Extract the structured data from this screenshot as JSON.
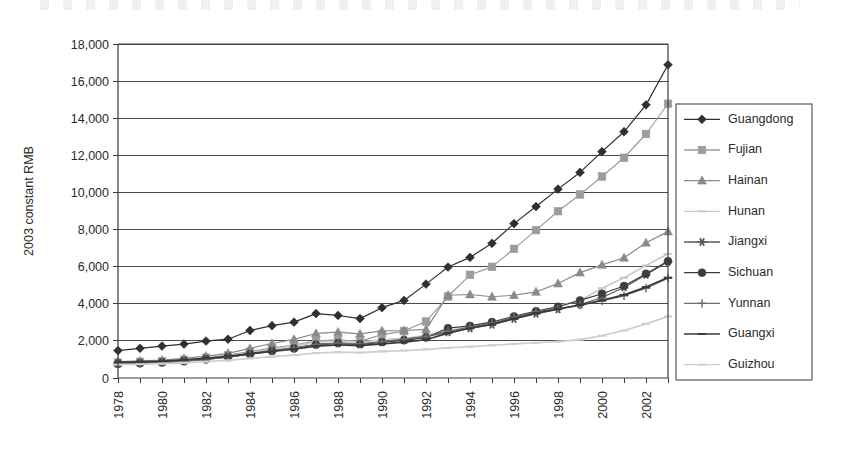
{
  "chart_data": {
    "type": "line",
    "title": "",
    "subtitle": "",
    "xlabel": "",
    "ylabel": "2003 constant RMB",
    "ylim": [
      0,
      18000
    ],
    "ytick_labels": [
      "0",
      "2,000",
      "4,000",
      "6,000",
      "8,000",
      "10,000",
      "12,000",
      "14,000",
      "16,000",
      "18,000"
    ],
    "ytick_values": [
      0,
      2000,
      4000,
      6000,
      8000,
      10000,
      12000,
      14000,
      16000,
      18000
    ],
    "grid": "horizontal",
    "legend_position": "right-outside",
    "x": [
      1978,
      1979,
      1980,
      1981,
      1982,
      1983,
      1984,
      1985,
      1986,
      1987,
      1988,
      1989,
      1990,
      1991,
      1992,
      1993,
      1994,
      1995,
      1996,
      1997,
      1998,
      1999,
      2000,
      2001,
      2002,
      2003
    ],
    "xtick_labels": [
      "1978",
      "1980",
      "1982",
      "1984",
      "1986",
      "1988",
      "1990",
      "1992",
      "1994",
      "1996",
      "1998",
      "2000",
      "2002"
    ],
    "xtick_values": [
      1978,
      1980,
      1982,
      1984,
      1986,
      1988,
      1990,
      1992,
      1994,
      1996,
      1998,
      2000,
      2002
    ],
    "series": [
      {
        "name": "Guangdong",
        "marker": "diamond",
        "color": "#2f2f2f",
        "values": [
          1480,
          1600,
          1720,
          1830,
          1990,
          2090,
          2560,
          2820,
          3010,
          3470,
          3370,
          3200,
          3790,
          4180,
          5060,
          5980,
          6500,
          7260,
          8320,
          9240,
          10180,
          11080,
          12200,
          13270,
          14720,
          16880
        ]
      },
      {
        "name": "Fujian",
        "marker": "square",
        "color": "#9c9c9c",
        "values": [
          830,
          870,
          900,
          980,
          1090,
          1230,
          1420,
          1620,
          1780,
          2000,
          2060,
          1980,
          2340,
          2530,
          3050,
          4390,
          5560,
          5990,
          6960,
          7970,
          8990,
          9890,
          10860,
          11870,
          13150,
          14780
        ]
      },
      {
        "name": "Hainan",
        "marker": "triangle",
        "color": "#8a8a8a",
        "values": [
          880,
          920,
          970,
          1060,
          1180,
          1330,
          1600,
          1860,
          2080,
          2400,
          2470,
          2380,
          2540,
          2560,
          2620,
          4460,
          4500,
          4380,
          4460,
          4640,
          5090,
          5680,
          6100,
          6480,
          7290,
          7890
        ]
      },
      {
        "name": "Hunan",
        "marker": "dash",
        "color": "#c9c9c9",
        "values": [
          790,
          820,
          860,
          940,
          1040,
          1170,
          1350,
          1540,
          1700,
          1930,
          1990,
          1930,
          2060,
          2140,
          2290,
          2540,
          2760,
          2960,
          3250,
          3540,
          3870,
          4180,
          4840,
          5400,
          6060,
          6690
        ]
      },
      {
        "name": "Jiangxi",
        "marker": "star",
        "color": "#585858",
        "values": [
          800,
          830,
          870,
          950,
          1060,
          1180,
          1330,
          1490,
          1610,
          1800,
          1870,
          1800,
          1930,
          2070,
          2230,
          2460,
          2680,
          2870,
          3180,
          3460,
          3700,
          3960,
          4340,
          4880,
          5560,
          6260
        ]
      },
      {
        "name": "Sichuan",
        "marker": "circle",
        "color": "#3d3d3d",
        "values": [
          760,
          790,
          830,
          900,
          1000,
          1120,
          1280,
          1450,
          1590,
          1800,
          1880,
          1830,
          1930,
          2030,
          2180,
          2690,
          2810,
          3020,
          3320,
          3600,
          3840,
          4180,
          4540,
          4960,
          5620,
          6300
        ]
      },
      {
        "name": "Yunnan",
        "marker": "plus",
        "color": "#6e6e6e",
        "values": [
          770,
          800,
          840,
          910,
          1000,
          1120,
          1290,
          1460,
          1610,
          1810,
          1880,
          1840,
          1960,
          2090,
          2240,
          2520,
          2740,
          2950,
          3280,
          3560,
          3740,
          3930,
          4150,
          4430,
          4840,
          5380
        ]
      },
      {
        "name": "Guangxi",
        "marker": "dash-dark",
        "color": "#3a3a3a",
        "values": [
          840,
          870,
          910,
          980,
          1060,
          1160,
          1300,
          1430,
          1550,
          1720,
          1790,
          1750,
          1840,
          1930,
          2060,
          2420,
          2680,
          2890,
          3200,
          3500,
          3720,
          3930,
          4190,
          4480,
          4900,
          5410
        ]
      },
      {
        "name": "Guizhou",
        "marker": "dash-light",
        "color": "#cfcfcf",
        "values": [
          720,
          740,
          770,
          820,
          880,
          950,
          1060,
          1150,
          1230,
          1340,
          1390,
          1370,
          1430,
          1480,
          1540,
          1620,
          1690,
          1760,
          1840,
          1900,
          1960,
          2070,
          2280,
          2560,
          2920,
          3320
        ]
      }
    ]
  },
  "legend": {
    "entries": [
      {
        "label": "Guangdong"
      },
      {
        "label": "Fujian"
      },
      {
        "label": "Hainan"
      },
      {
        "label": "Hunan"
      },
      {
        "label": "Jiangxi"
      },
      {
        "label": "Sichuan"
      },
      {
        "label": "Yunnan"
      },
      {
        "label": "Guangxi"
      },
      {
        "label": "Guizhou"
      }
    ]
  }
}
